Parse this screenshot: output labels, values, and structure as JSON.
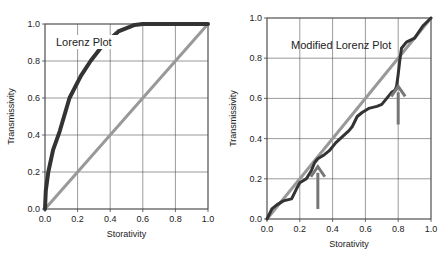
{
  "chart_data": [
    {
      "type": "line",
      "annotation": "Lorenz Plot",
      "xlabel": "Storativity",
      "ylabel": "Transmissivity",
      "xlim": [
        0,
        1
      ],
      "ylim": [
        0,
        1
      ],
      "grid": true,
      "x_ticks": [
        "0.0",
        "0.2",
        "0.4",
        "0.6",
        "0.8",
        "1.0"
      ],
      "y_ticks": [
        "0.0",
        "0.2",
        "0.4",
        "0.6",
        "0.8",
        "1.0"
      ],
      "series": [
        {
          "name": "Lorenz curve",
          "color": "#333333",
          "x": [
            0,
            0.005,
            0.02,
            0.05,
            0.09,
            0.15,
            0.22,
            0.28,
            0.35,
            0.45,
            0.55,
            0.6,
            1.0
          ],
          "y": [
            0,
            0.1,
            0.2,
            0.32,
            0.42,
            0.6,
            0.72,
            0.8,
            0.88,
            0.96,
            0.995,
            1.0,
            1.0
          ]
        },
        {
          "name": "Homogeneous line",
          "color": "#999999",
          "x": [
            0,
            1
          ],
          "y": [
            0,
            1
          ]
        }
      ]
    },
    {
      "type": "line",
      "annotation": "Modified Lorenz Plot",
      "xlabel": "Storativity",
      "ylabel": "Transmissivity",
      "xlim": [
        0,
        1
      ],
      "ylim": [
        0,
        1
      ],
      "grid": true,
      "x_ticks": [
        "0.0",
        "0.2",
        "0.4",
        "0.6",
        "0.8",
        "1.0"
      ],
      "y_ticks": [
        "0.0",
        "0.2",
        "0.4",
        "0.6",
        "0.8",
        "1.0"
      ],
      "series": [
        {
          "name": "Modified Lorenz curve",
          "color": "#333333",
          "x": [
            0,
            0.03,
            0.06,
            0.1,
            0.15,
            0.18,
            0.2,
            0.24,
            0.27,
            0.29,
            0.31,
            0.35,
            0.38,
            0.42,
            0.46,
            0.5,
            0.52,
            0.55,
            0.58,
            0.62,
            0.67,
            0.7,
            0.73,
            0.76,
            0.78,
            0.79,
            0.8,
            0.81,
            0.82,
            0.85,
            0.9,
            0.95,
            1.0
          ],
          "y": [
            0,
            0.05,
            0.07,
            0.09,
            0.1,
            0.15,
            0.18,
            0.2,
            0.24,
            0.28,
            0.3,
            0.32,
            0.34,
            0.38,
            0.41,
            0.44,
            0.46,
            0.51,
            0.53,
            0.55,
            0.56,
            0.57,
            0.6,
            0.63,
            0.64,
            0.66,
            0.72,
            0.79,
            0.85,
            0.88,
            0.9,
            0.96,
            1.0
          ]
        },
        {
          "name": "Homogeneous line",
          "color": "#999999",
          "x": [
            0,
            1
          ],
          "y": [
            0,
            1
          ]
        }
      ],
      "arrows": [
        {
          "x": 0.31,
          "y_tip": 0.26,
          "y_tail": 0.05
        },
        {
          "x": 0.8,
          "y_tip": 0.66,
          "y_tail": 0.47
        }
      ]
    }
  ],
  "left": {
    "title": "Lorenz Plot",
    "xlabel": "Storativity",
    "ylabel": "Transmissivity"
  },
  "right": {
    "title": "Modified Lorenz Plot",
    "xlabel": "Storativity",
    "ylabel": "Transmissivity"
  }
}
